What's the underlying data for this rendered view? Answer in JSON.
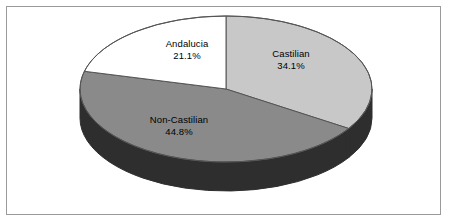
{
  "chart_data": {
    "type": "pie",
    "title": "",
    "subtitle": "",
    "xlabel": "",
    "ylabel": "",
    "three_d": true,
    "legend_position": "none",
    "labels_inside_slices": true,
    "start_angle_deg": 0,
    "direction": "clockwise",
    "categories": [
      "Castilian",
      "Non-Castilian",
      "Andalucia"
    ],
    "values": [
      34.1,
      44.8,
      21.1
    ],
    "value_suffix": "%",
    "slices": [
      {
        "name": "Castilian",
        "value": 34.1,
        "label_name": "Castilian",
        "label_value": "34.1%",
        "color": "#c8c8c8",
        "side_color": "#2e2e2e",
        "start_deg": 0,
        "end_deg": 122.76
      },
      {
        "name": "Non-Castilian",
        "value": 44.8,
        "label_name": "Non-Castilian",
        "label_value": "44.8%",
        "color": "#8a8a8a",
        "side_color": "#2e2e2e",
        "start_deg": 122.76,
        "end_deg": 284.04
      },
      {
        "name": "Andalucia",
        "value": 21.1,
        "label_name": "Andalucia",
        "label_value": "21.1%",
        "color": "#ffffff",
        "side_color": "#2e2e2e",
        "start_deg": 284.04,
        "end_deg": 360
      }
    ]
  },
  "figure": {
    "background_color": "#ffffff",
    "border_color": "#9a9a9a",
    "outline_color": "#555555",
    "text_color": "#000000"
  },
  "geometry": {
    "center_x": 226,
    "center_y": 89,
    "radius_x": 146,
    "radius_y": 73,
    "depth": 29
  }
}
